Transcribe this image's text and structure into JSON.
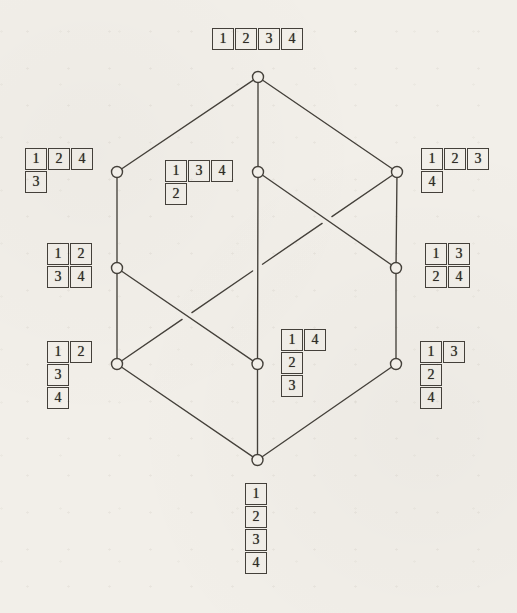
{
  "figure": {
    "paper_color": "#f2efe9",
    "ink_color": "#44403a",
    "digit_color": "#2e2b26"
  },
  "graph": {
    "node_radius": 5.5,
    "gap_half_px": 6,
    "nodes": [
      {
        "id": "top",
        "x": 258,
        "y": 77
      },
      {
        "id": "l2-left",
        "x": 117,
        "y": 172
      },
      {
        "id": "l2-mid",
        "x": 258,
        "y": 172
      },
      {
        "id": "l2-right",
        "x": 397,
        "y": 172
      },
      {
        "id": "l3-left",
        "x": 117,
        "y": 268
      },
      {
        "id": "l3-right",
        "x": 396,
        "y": 268
      },
      {
        "id": "l4-left",
        "x": 117,
        "y": 364
      },
      {
        "id": "l4-mid",
        "x": 257.5,
        "y": 364
      },
      {
        "id": "l4-right",
        "x": 396,
        "y": 364
      },
      {
        "id": "bottom",
        "x": 257.5,
        "y": 460
      }
    ],
    "edges": [
      {
        "from": "top",
        "to": "l2-left"
      },
      {
        "from": "top",
        "to": "l2-mid"
      },
      {
        "from": "top",
        "to": "l2-right"
      },
      {
        "from": "l2-left",
        "to": "l3-left"
      },
      {
        "from": "l2-mid",
        "to": "l3-right"
      },
      {
        "from": "l2-mid",
        "to": "l4-mid"
      },
      {
        "from": "l2-right",
        "to": "l3-right"
      },
      {
        "from": "l2-right",
        "to": "l4-left",
        "gaps": [
          0.25,
          0.498,
          0.75
        ]
      },
      {
        "from": "l3-left",
        "to": "l4-left"
      },
      {
        "from": "l3-left",
        "to": "l4-mid"
      },
      {
        "from": "l3-right",
        "to": "l4-right"
      },
      {
        "from": "l4-left",
        "to": "bottom"
      },
      {
        "from": "l4-mid",
        "to": "bottom"
      },
      {
        "from": "l4-right",
        "to": "bottom"
      }
    ]
  },
  "tableaux": [
    {
      "id": "row-1234",
      "node": "top",
      "x": 212,
      "y": 28,
      "rows": [
        [
          1,
          2,
          3,
          4
        ]
      ]
    },
    {
      "id": "124-3",
      "node": "l2-left",
      "x": 25,
      "y": 148,
      "rows": [
        [
          1,
          2,
          4
        ],
        [
          3
        ]
      ]
    },
    {
      "id": "134-2",
      "node": "l2-mid",
      "x": 165,
      "y": 160,
      "rows": [
        [
          1,
          3,
          4
        ],
        [
          2
        ]
      ]
    },
    {
      "id": "123-4",
      "node": "l2-right",
      "x": 421,
      "y": 148,
      "rows": [
        [
          1,
          2,
          3
        ],
        [
          4
        ]
      ]
    },
    {
      "id": "12-34",
      "node": "l3-left",
      "x": 47,
      "y": 243,
      "rows": [
        [
          1,
          2
        ],
        [
          3,
          4
        ]
      ]
    },
    {
      "id": "13-24",
      "node": "l3-right",
      "x": 425,
      "y": 243,
      "rows": [
        [
          1,
          3
        ],
        [
          2,
          4
        ]
      ]
    },
    {
      "id": "12-3-4",
      "node": "l4-left",
      "x": 47,
      "y": 341,
      "rows": [
        [
          1,
          2
        ],
        [
          3
        ],
        [
          4
        ]
      ]
    },
    {
      "id": "14-2-3",
      "node": "l4-mid",
      "x": 281,
      "y": 329,
      "rows": [
        [
          1,
          4
        ],
        [
          2
        ],
        [
          3
        ]
      ]
    },
    {
      "id": "13-2-4",
      "node": "l4-right",
      "x": 420,
      "y": 341,
      "rows": [
        [
          1,
          3
        ],
        [
          2
        ],
        [
          4
        ]
      ]
    },
    {
      "id": "col-1-2-3-4",
      "node": "bottom",
      "x": 245,
      "y": 483,
      "rows": [
        [
          1
        ],
        [
          2
        ],
        [
          3
        ],
        [
          4
        ]
      ]
    }
  ]
}
